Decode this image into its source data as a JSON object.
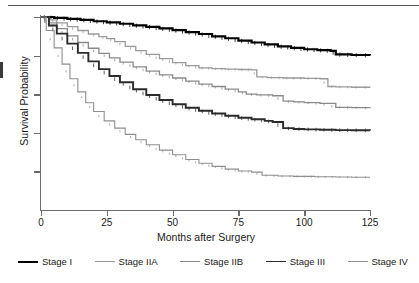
{
  "figure": {
    "name": "kaplan-meier-survival-by-stage"
  },
  "axes": {
    "y_title": "Survival Probability",
    "x_title": "Months after Surgery",
    "x_ticks": [
      "0",
      "25",
      "50",
      "75",
      "100",
      "125"
    ],
    "y_tick_count": 5
  },
  "legend": [
    {
      "label": "Stage I",
      "color": "#000000",
      "width": 2.2
    },
    {
      "label": "Stage IIA",
      "color": "#9a9a9a",
      "width": 1.3
    },
    {
      "label": "Stage IIB",
      "color": "#8a8a8a",
      "width": 1.3
    },
    {
      "label": "Stage III",
      "color": "#2b2b2b",
      "width": 1.9
    },
    {
      "label": "Stage IV",
      "color": "#8f8f8f",
      "width": 1.1
    }
  ],
  "chart_data": {
    "type": "line",
    "title": "",
    "subtitle": "",
    "xlabel": "Months after Surgery",
    "ylabel": "Survival Probability",
    "xlim": [
      0,
      125
    ],
    "ylim": [
      0.0,
      1.0
    ],
    "xticks": [
      0,
      25,
      50,
      75,
      100,
      125
    ],
    "yticks": [
      0.2,
      0.4,
      0.6,
      0.8,
      1.0
    ],
    "ytick_labels_visible": false,
    "grid": false,
    "legend_position": "below",
    "curve_style": "step",
    "censoring_marks": true,
    "series": [
      {
        "name": "Stage I",
        "color": "#000000",
        "x": [
          0,
          5,
          10,
          15,
          20,
          25,
          30,
          35,
          40,
          45,
          50,
          55,
          60,
          65,
          70,
          75,
          80,
          85,
          90,
          95,
          100,
          105,
          110,
          112,
          118,
          125
        ],
        "y": [
          1.0,
          0.995,
          0.99,
          0.985,
          0.978,
          0.972,
          0.965,
          0.957,
          0.949,
          0.941,
          0.932,
          0.922,
          0.912,
          0.9,
          0.89,
          0.878,
          0.868,
          0.858,
          0.848,
          0.84,
          0.833,
          0.828,
          0.824,
          0.806,
          0.803,
          0.801
        ]
      },
      {
        "name": "Stage IIA",
        "color": "#9a9a9a",
        "x": [
          0,
          3,
          6,
          10,
          14,
          18,
          22,
          25,
          28,
          32,
          36,
          40,
          45,
          50,
          55,
          60,
          65,
          70,
          75,
          80,
          82,
          86,
          92,
          100,
          106,
          109,
          112,
          118,
          125
        ],
        "y": [
          1.0,
          0.985,
          0.97,
          0.95,
          0.93,
          0.912,
          0.898,
          0.888,
          0.872,
          0.848,
          0.826,
          0.806,
          0.784,
          0.764,
          0.748,
          0.736,
          0.732,
          0.73,
          0.728,
          0.726,
          0.69,
          0.686,
          0.684,
          0.682,
          0.68,
          0.64,
          0.638,
          0.636,
          0.635
        ]
      },
      {
        "name": "Stage IIB",
        "color": "#8a8a8a",
        "x": [
          0,
          3,
          6,
          10,
          14,
          18,
          22,
          26,
          30,
          35,
          40,
          45,
          50,
          55,
          60,
          65,
          70,
          75,
          78,
          82,
          88,
          92,
          96,
          100,
          106,
          112,
          118,
          125
        ],
        "y": [
          1.0,
          0.97,
          0.94,
          0.902,
          0.868,
          0.838,
          0.812,
          0.788,
          0.766,
          0.742,
          0.72,
          0.7,
          0.684,
          0.668,
          0.652,
          0.64,
          0.626,
          0.612,
          0.6,
          0.596,
          0.592,
          0.564,
          0.56,
          0.556,
          0.552,
          0.532,
          0.53,
          0.528
        ]
      },
      {
        "name": "Stage III",
        "color": "#2b2b2b",
        "x": [
          0,
          3,
          6,
          10,
          14,
          18,
          22,
          26,
          30,
          35,
          40,
          45,
          50,
          55,
          60,
          65,
          70,
          75,
          80,
          85,
          88,
          92,
          96,
          100,
          106,
          112,
          118,
          125
        ],
        "y": [
          1.0,
          0.956,
          0.914,
          0.862,
          0.814,
          0.77,
          0.73,
          0.694,
          0.662,
          0.626,
          0.596,
          0.57,
          0.548,
          0.53,
          0.514,
          0.5,
          0.488,
          0.478,
          0.47,
          0.462,
          0.456,
          0.424,
          0.42,
          0.418,
          0.416,
          0.414,
          0.413,
          0.412
        ]
      },
      {
        "name": "Stage IV",
        "color": "#8f8f8f",
        "x": [
          0,
          2,
          5,
          8,
          11,
          14,
          17,
          20,
          24,
          28,
          32,
          36,
          40,
          45,
          50,
          55,
          60,
          65,
          70,
          75,
          80,
          84,
          90,
          96,
          104,
          112,
          118,
          125
        ],
        "y": [
          1.0,
          0.93,
          0.84,
          0.756,
          0.68,
          0.612,
          0.556,
          0.51,
          0.462,
          0.424,
          0.392,
          0.364,
          0.338,
          0.31,
          0.286,
          0.262,
          0.242,
          0.226,
          0.212,
          0.202,
          0.196,
          0.18,
          0.176,
          0.174,
          0.172,
          0.171,
          0.17,
          0.17
        ]
      }
    ]
  }
}
